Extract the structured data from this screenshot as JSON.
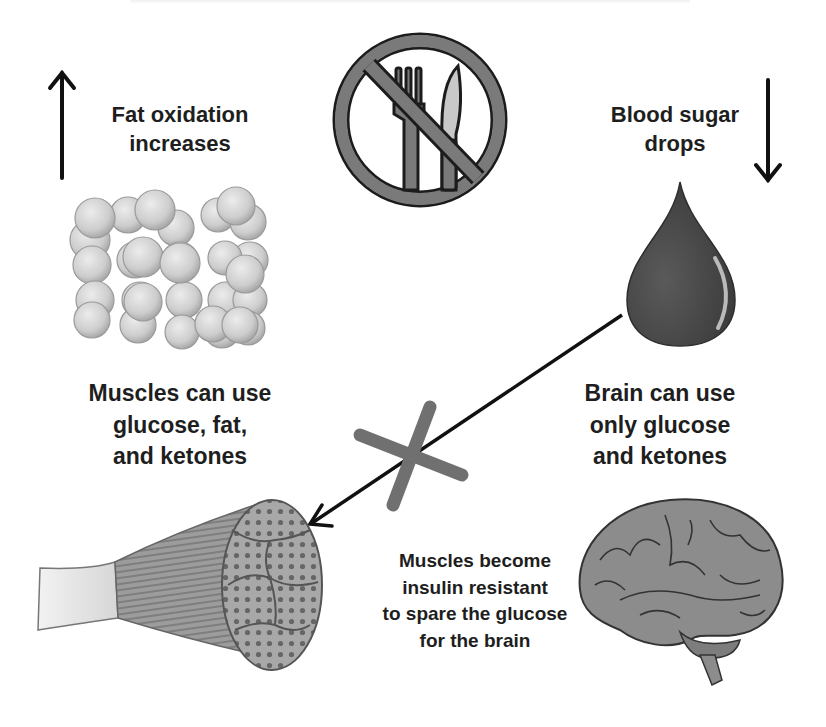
{
  "diagram": {
    "type": "infographic",
    "colors": {
      "text": "#1e1e1e",
      "icon_gray": "#6f6f6f",
      "light_gray": "#cfcfcf",
      "blood_drop": "#4a4a4a",
      "cross_mark": "#707070"
    },
    "icons": {
      "no_eating": "no-eating-icon",
      "up_arrow": "arrow-up-icon",
      "down_arrow": "arrow-down-icon",
      "fat_cells": "fat-cells-icon",
      "blood_drop": "blood-drop-icon",
      "muscle": "muscle-fiber-icon",
      "brain": "brain-icon",
      "blocked_cross": "x-mark-icon"
    },
    "labels": {
      "fat_oxidation": [
        "Fat oxidation",
        "increases"
      ],
      "blood_sugar": [
        "Blood sugar",
        "drops"
      ],
      "muscles_use": [
        "Muscles can use",
        "glucose, fat,",
        "and ketones"
      ],
      "brain_use": [
        "Brain can use",
        "only glucose",
        "and ketones"
      ],
      "insulin_resistance": [
        "Muscles become",
        "insulin resistant",
        "to spare the glucose",
        "for the brain"
      ]
    },
    "connections": [
      {
        "from": "blood-drop",
        "to": "muscle",
        "blocked": true
      }
    ]
  }
}
